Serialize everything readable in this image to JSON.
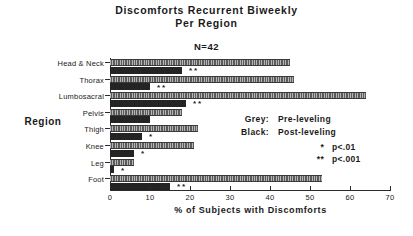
{
  "chart": {
    "title_lines": [
      "Discomforts  Recurrent  Biweekly",
      "Per Region"
    ],
    "subtitle": "N=42",
    "xlabel": "% of Subjects with Discomforts",
    "ylabel": "Region"
  },
  "legend": {
    "rows": [
      {
        "key": "Grey:",
        "value": "Pre-leveling"
      },
      {
        "key": "Black:",
        "value": "Post-leveling"
      }
    ],
    "pvalues": [
      {
        "marker": "*",
        "text": "p<.01"
      },
      {
        "marker": "**",
        "text": "p<.001"
      }
    ]
  },
  "chart_data": {
    "type": "bar",
    "orientation": "horizontal",
    "title": "Discomforts Recurrent Biweekly Per Region",
    "subtitle": "N=42",
    "xlabel": "% of Subjects with Discomforts",
    "ylabel": "Region",
    "xlim": [
      0,
      70
    ],
    "xticks": [
      0,
      10,
      20,
      30,
      40,
      50,
      60,
      70
    ],
    "grid": false,
    "legend_position": "right",
    "categories": [
      "Head & Neck",
      "Thorax",
      "Lumbosacral",
      "Pelvis",
      "Thigh",
      "Knee",
      "Leg",
      "Foot"
    ],
    "series": [
      {
        "name": "Pre-leveling",
        "color": "#5b5b5b",
        "values": [
          45,
          46,
          64,
          18,
          22,
          21,
          6,
          53
        ]
      },
      {
        "name": "Post-leveling",
        "color": "#242424",
        "values": [
          18,
          10,
          19,
          10,
          8,
          6,
          1,
          15
        ]
      }
    ],
    "significance": [
      "**",
      "**",
      "**",
      "",
      "*",
      "*",
      "*",
      "**"
    ]
  }
}
